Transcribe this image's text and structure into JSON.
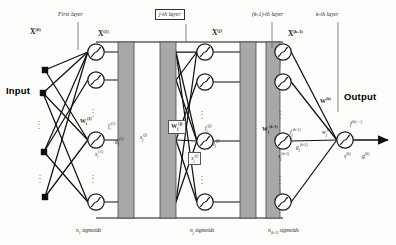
{
  "figure": {
    "input_label": "Input",
    "output_label": "Output"
  },
  "colors": {
    "line": "#111111",
    "node_fill": "#ffffff",
    "node_stroke": "#1a1a1a",
    "bar_fill": "#a8a8a8",
    "bar_stroke": "#4a4a4a",
    "input_square": "#0d0d0d",
    "background": "#fdfdfc"
  },
  "layer_tags": [
    {
      "id": "first",
      "text": "First layer",
      "boxed": false,
      "x": 58,
      "y": 12
    },
    {
      "id": "jth",
      "text": "j-th layer",
      "boxed": true,
      "x": 155,
      "y": 9
    },
    {
      "id": "k_minus_1",
      "text": "(k-1)-th layer",
      "boxed": false,
      "x": 252,
      "y": 12
    },
    {
      "id": "kth",
      "text": "k-th layer",
      "boxed": false,
      "x": 316,
      "y": 12
    }
  ],
  "x_labels": [
    {
      "id": "x0",
      "base": "X",
      "sup": "(0)",
      "x": 30,
      "y": 28
    },
    {
      "id": "x1",
      "base": "X",
      "sup": "(1)",
      "x": 98,
      "y": 30
    },
    {
      "id": "xj",
      "base": "X",
      "sup": "(j)",
      "x": 212,
      "y": 29
    },
    {
      "id": "xk1",
      "base": "X",
      "sup": "(k-1)",
      "x": 288,
      "y": 30
    }
  ],
  "bottom_labels": [
    {
      "id": "n1",
      "base": "n",
      "sub": "1",
      "text": " sigmoids",
      "x": 76,
      "y": 228
    },
    {
      "id": "nj",
      "base": "n",
      "sub": "j",
      "text": " sigmoids",
      "x": 190,
      "y": 228
    },
    {
      "id": "nk1",
      "base": "n",
      "sub": "(k-1)",
      "text": " sigmoids",
      "x": 268,
      "y": 228
    }
  ],
  "weight_labels": [
    {
      "id": "w1",
      "base": "W",
      "sub": "i",
      "sup": "(1)",
      "boxed": false,
      "x": 80,
      "y": 117
    },
    {
      "id": "wj",
      "base": "W",
      "sub": "j",
      "sup": "(j)",
      "boxed": true,
      "x": 168,
      "y": 120
    },
    {
      "id": "wk1",
      "base": "W",
      "sub": "j",
      "sup": "(k-1)",
      "boxed": false,
      "x": 262,
      "y": 125
    },
    {
      "id": "wk",
      "base": "W",
      "sub": "",
      "sup": "(k)",
      "boxed": false,
      "x": 320,
      "y": 97
    }
  ],
  "signal_labels": [
    {
      "id": "f1",
      "base": "f",
      "sub": "i",
      "sup": "(1)",
      "boxed": false,
      "x": 108,
      "y": 122
    },
    {
      "id": "g1",
      "base": "g",
      "sub": "i",
      "sup": "(1)",
      "boxed": false,
      "x": 115,
      "y": 137
    },
    {
      "id": "s1",
      "base": "s",
      "sub": "i",
      "sup": "(1)",
      "boxed": false,
      "x": 95,
      "y": 150
    },
    {
      "id": "sj_in",
      "base": "s",
      "sub": "j",
      "sup": "(j)",
      "boxed": false,
      "x": 140,
      "y": 133
    },
    {
      "id": "fj",
      "base": "f",
      "sub": "j",
      "sup": "(j)",
      "boxed": false,
      "x": 205,
      "y": 124
    },
    {
      "id": "gj",
      "base": "g",
      "sub": "j",
      "sup": "(j)",
      "boxed": false,
      "x": 212,
      "y": 139
    },
    {
      "id": "sj",
      "base": "s",
      "sub": "j",
      "sup": "(j)",
      "boxed": true,
      "x": 188,
      "y": 152
    },
    {
      "id": "fk1",
      "base": "f",
      "sub": "j",
      "sup": "(k-1)",
      "boxed": false,
      "x": 290,
      "y": 128
    },
    {
      "id": "gk1",
      "base": "g",
      "sub": "j",
      "sup": "(k-1)",
      "boxed": false,
      "x": 296,
      "y": 143
    },
    {
      "id": "sk1",
      "base": "s",
      "sub": "j",
      "sup": "(k-1)",
      "boxed": false,
      "x": 278,
      "y": 152
    },
    {
      "id": "wjk",
      "base": "w",
      "sub": "j",
      "sup": "(k)",
      "boxed": false,
      "x": 322,
      "y": 128
    },
    {
      "id": "fk",
      "base": "f",
      "sub": "",
      "sup": "(k) = f",
      "boxed": false,
      "x": 350,
      "y": 120
    },
    {
      "id": "sk",
      "base": "s",
      "sub": "",
      "sup": "(k)",
      "boxed": false,
      "x": 344,
      "y": 152
    },
    {
      "id": "gk",
      "base": "g",
      "sub": "",
      "sup": "(k)",
      "boxed": false,
      "x": 362,
      "y": 152
    }
  ],
  "input_nodes": [
    {
      "id": "in-1",
      "cx": 45,
      "cy": 70
    },
    {
      "id": "in-2",
      "cx": 43,
      "cy": 93
    },
    {
      "id": "in-3",
      "cx": 44,
      "cy": 152
    },
    {
      "id": "in-4",
      "cx": 45,
      "cy": 197
    }
  ],
  "neuron_columns": [
    {
      "id": "col-1",
      "cx": 96,
      "neurons": [
        52,
        80,
        140,
        202
      ]
    },
    {
      "id": "col-j",
      "cx": 205,
      "neurons": [
        52,
        82,
        141,
        202
      ]
    },
    {
      "id": "col-k1",
      "cx": 283,
      "neurons": [
        52,
        82,
        141,
        202
      ]
    }
  ],
  "output_node": {
    "id": "out",
    "cx": 345,
    "cy": 140
  },
  "bars": [
    {
      "id": "bar-1",
      "x": 118,
      "y": 42,
      "w": 16,
      "h": 176
    },
    {
      "id": "bar-2",
      "x": 160,
      "y": 42,
      "w": 16,
      "h": 176
    },
    {
      "id": "bar-3",
      "x": 240,
      "y": 42,
      "w": 16,
      "h": 176
    },
    {
      "id": "bar-4",
      "x": 266,
      "y": 42,
      "w": 14,
      "h": 176
    }
  ],
  "ellipsis_marks": [
    {
      "id": "e-in-1",
      "x": 42,
      "y": 118
    },
    {
      "id": "e-in-2",
      "x": 43,
      "y": 172
    },
    {
      "id": "e-c1-1",
      "x": 96,
      "y": 106
    },
    {
      "id": "e-c1-2",
      "x": 96,
      "y": 172
    },
    {
      "id": "e-cj-1",
      "x": 205,
      "y": 108
    },
    {
      "id": "e-cj-2",
      "x": 205,
      "y": 173
    },
    {
      "id": "e-ck-1",
      "x": 283,
      "y": 108
    },
    {
      "id": "e-ck-2",
      "x": 283,
      "y": 173
    }
  ]
}
